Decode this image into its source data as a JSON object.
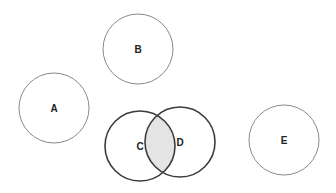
{
  "diagram": {
    "type": "set-circles",
    "colors": {
      "background": "#ffffff",
      "light_stroke": "#8a8a8a",
      "dark_stroke": "#3c3c3c",
      "intersection_fill": "#e4e4e4",
      "label": "#222222"
    },
    "circles": [
      {
        "id": "A",
        "label": "A",
        "cx": 54,
        "cy": 108,
        "r": 35,
        "style": "light"
      },
      {
        "id": "B",
        "label": "B",
        "cx": 138,
        "cy": 49,
        "r": 35,
        "style": "light"
      },
      {
        "id": "C",
        "label": "C",
        "cx": 140,
        "cy": 146,
        "r": 35,
        "style": "dark"
      },
      {
        "id": "D",
        "label": "D",
        "cx": 180,
        "cy": 142,
        "r": 35,
        "style": "dark"
      },
      {
        "id": "E",
        "label": "E",
        "cx": 284,
        "cy": 140,
        "r": 35,
        "style": "light"
      }
    ],
    "shaded_region": {
      "sets": [
        "C",
        "D"
      ],
      "description": "intersection of C and D"
    }
  }
}
